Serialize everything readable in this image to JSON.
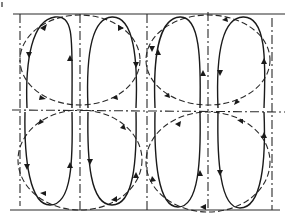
{
  "diagram": {
    "type": "flow-cell-pattern",
    "colors": {
      "ink": "#1a1a1a",
      "background": "#ffffff"
    },
    "frame": {
      "top_line": {
        "x1": 13,
        "x2": 285,
        "y": 14
      },
      "bottom_line": {
        "x1": 10,
        "x2": 280,
        "y": 210
      },
      "corner_tick": {
        "x": 2,
        "y": 3
      }
    },
    "axes": {
      "vertical_dashed_x": [
        20,
        80,
        147,
        208,
        272
      ],
      "horizontal_dashed_y": 110
    },
    "cells": [
      {
        "id": "upper-left",
        "ellipse": {
          "cx": 80,
          "cy": 60,
          "rx": 60,
          "ry": 45
        }
      },
      {
        "id": "upper-right",
        "ellipse": {
          "cx": 208,
          "cy": 60,
          "rx": 60,
          "ry": 45
        }
      },
      {
        "id": "lower-left",
        "ellipse": {
          "cx": 80,
          "cy": 160,
          "rx": 62,
          "ry": 50
        }
      },
      {
        "id": "lower-right",
        "ellipse": {
          "cx": 208,
          "cy": 160,
          "rx": 62,
          "ry": 50
        }
      }
    ],
    "streamline_loops": 8,
    "labels": []
  }
}
